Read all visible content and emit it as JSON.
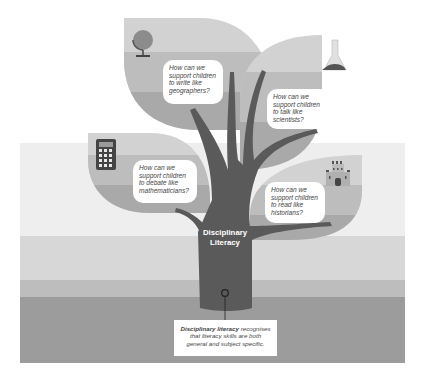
{
  "diagram": {
    "title": "Disciplinary Literacy",
    "trunk_label_line1": "Disciplinary",
    "trunk_label_line2": "Literacy",
    "leaves": [
      {
        "id": "geography",
        "icon": "globe-icon",
        "question": "How can we support children to write like geographers?",
        "lines": [
          "How can we",
          "support children",
          "to write like",
          "geographers?"
        ]
      },
      {
        "id": "science",
        "icon": "flask-icon",
        "question": "How can we support children to talk like scientists?",
        "lines": [
          "How can we",
          "support children",
          "to talk like",
          "scientists?"
        ]
      },
      {
        "id": "maths",
        "icon": "calculator-icon",
        "question": "How can we support children to debate like mathematicians?",
        "lines": [
          "How can we",
          "support children",
          "to debate like",
          "mathematicians?"
        ]
      },
      {
        "id": "history",
        "icon": "castle-icon",
        "question": "How can we support children to read like historians?",
        "lines": [
          "How can we",
          "support children",
          "to read like",
          "historians?"
        ]
      }
    ],
    "caption": {
      "bold": "Disciplinary literacy",
      "rest_line1": " recognises",
      "line2": "that literacy skills are both",
      "line3": "general and subject specific."
    },
    "colors": {
      "background": "#ffffff",
      "band_light": "#eeeeee",
      "band_mid": "#d7d7d7",
      "band_midDark": "#bdbdbd",
      "band_dark": "#9c9c9c",
      "trunk": "#5a5a5a",
      "leaf_light": "#cfcfcf",
      "leaf_mid": "#b7b7b7",
      "leaf_dark": "#a6a6a6"
    }
  }
}
